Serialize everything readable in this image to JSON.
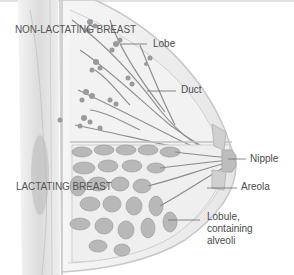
{
  "diagram": {
    "style": "grayscale anatomical illustration, sagittal section of breast",
    "colors": {
      "background": "#ffffff",
      "tissue_light": "#eeeeee",
      "tissue_mid": "#c8c8c8",
      "structure_dark": "#8a8a8a",
      "label_text": "#4a4a4a",
      "leader_line": "#6a6a6a"
    },
    "sections": [
      {
        "id": "upper",
        "label": "NON-LACTATING BREAST"
      },
      {
        "id": "lower",
        "label": "LACTATING BREAST"
      }
    ],
    "labels": [
      {
        "id": "lobe",
        "text": "Lobe"
      },
      {
        "id": "duct",
        "text": "Duct"
      },
      {
        "id": "nipple",
        "text": "Nipple"
      },
      {
        "id": "areola",
        "text": "Areola"
      },
      {
        "id": "lobule",
        "text": "Lobule, containing alveoli"
      }
    ]
  }
}
